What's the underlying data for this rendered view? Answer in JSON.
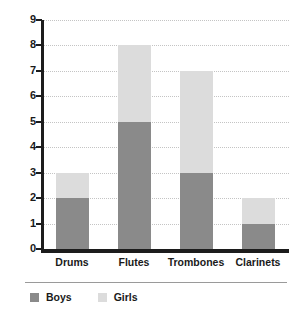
{
  "chart_data": {
    "type": "bar",
    "subtype": "stacked-bar",
    "title": "",
    "xlabel": "",
    "ylabel": "",
    "ylim": [
      0,
      9
    ],
    "ytick_labels": [
      "9",
      "8",
      "7",
      "6",
      "5",
      "4",
      "3",
      "2",
      "1",
      "0"
    ],
    "yticks": [
      9,
      8,
      7,
      6,
      5,
      4,
      3,
      2,
      1,
      0
    ],
    "grid": true,
    "grid_axis": "y",
    "grid_style": "dotted",
    "legend_position": "bottom-left",
    "categories": [
      "Drums",
      "Flutes",
      "Trombones",
      "Clarinets"
    ],
    "series": [
      {
        "name": "Boys",
        "color": "#8a8a8a",
        "values": [
          2,
          5,
          3,
          1
        ]
      },
      {
        "name": "Girls",
        "color": "#dcdcdc",
        "values": [
          1,
          3,
          4,
          1
        ]
      }
    ],
    "totals": [
      3,
      8,
      7,
      2
    ],
    "axis_color": "#1c1c1c",
    "gridline_color": "#c4c4c4",
    "background_color": "#ffffff"
  },
  "legend": {
    "items": [
      {
        "label": "Boys",
        "color": "#8a8a8a"
      },
      {
        "label": "Girls",
        "color": "#dcdcdc"
      }
    ]
  }
}
